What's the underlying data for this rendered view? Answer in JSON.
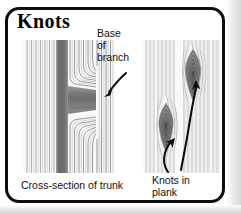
{
  "figure": {
    "title": "Knots",
    "border_color": "#0d0d0d",
    "background_color": "#ffffff"
  },
  "panels": [
    {
      "id": "cross-section-of-trunk",
      "caption": "Cross-section of trunk",
      "description": "vertical wood grain with dark vertical trunk band and a horizontal branch base where grain curves",
      "grain_color": "#b9b9b9",
      "dark_band_color": "#7d7d7d"
    },
    {
      "id": "knots-in-plank",
      "caption": "Knots in plank",
      "description": "sawn plank face showing two lens-shaped knots with concentric rings",
      "grain_color": "#c2c2c2",
      "knot_color": "#8a8a8a"
    }
  ],
  "annotations": [
    {
      "id": "base-of-branch",
      "text": "Base\nof\nbranch",
      "arrow": "curved arrow pointing down-left to the branch base"
    },
    {
      "id": "knots-in-plank",
      "text": "Knots in\nplank",
      "arrow": "two curved arrows pointing up to each knot"
    }
  ],
  "captions": {
    "left": "Cross-section of trunk",
    "right": "Knots in\nplank"
  }
}
